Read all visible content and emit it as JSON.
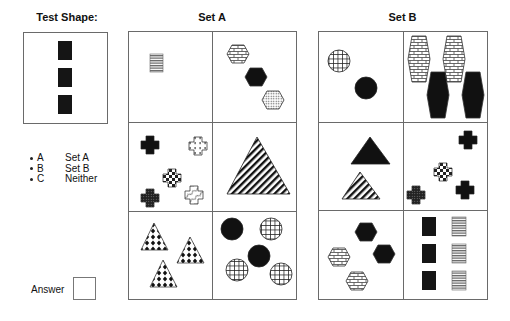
{
  "headings": {
    "test_shape": "Test Shape:",
    "set_a": "Set A",
    "set_b": "Set B"
  },
  "options": [
    {
      "key": "A",
      "label": "Set A"
    },
    {
      "key": "B",
      "label": "Set B"
    },
    {
      "key": "C",
      "label": "Neither"
    }
  ],
  "answer": {
    "label": "Answer",
    "value": ""
  },
  "test_shape": {
    "description": "three black rectangles stacked vertically",
    "shapes": [
      {
        "type": "rect",
        "fill": "black"
      },
      {
        "type": "rect",
        "fill": "black"
      },
      {
        "type": "rect",
        "fill": "black"
      }
    ]
  },
  "set_a": {
    "cells": [
      {
        "description": "one horizontally-striped rectangle"
      },
      {
        "description": "three hexagons: brick, black, dotted"
      },
      {
        "description": "five crosses: black, dotted, checkered, dark dotted, wavy"
      },
      {
        "description": "one large diagonal-striped triangle"
      },
      {
        "description": "three triangles with black diamond pattern"
      },
      {
        "description": "five circles: two black, three grid"
      }
    ]
  },
  "set_b": {
    "cells": [
      {
        "description": "two circles: grid, black"
      },
      {
        "description": "four tall hexagons: two brick, two black"
      },
      {
        "description": "two triangles: black, diagonal-striped"
      },
      {
        "description": "four crosses: black, checkered, dark dotted, black"
      },
      {
        "description": "four hexagons: two black, two brick"
      },
      {
        "description": "six rectangles: three black, three striped"
      }
    ]
  },
  "colors": {
    "border": "#6a6a6a",
    "shape_dark": "#111111",
    "stripe_gray": "#777777"
  }
}
